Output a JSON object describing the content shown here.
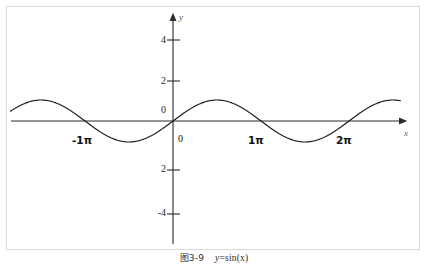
{
  "figure": {
    "caption_number": "图3-9",
    "caption_expression": "y=sin(x)",
    "caption_expr_lhs": "y",
    "caption_expr_rhs": "=sin(x)",
    "background_color": "#ffffff",
    "frame_color": "#d9d9d9",
    "curve_color": "#1a1a1a",
    "axis_color": "#2b2b2b"
  },
  "axes": {
    "x_axis_name": "x",
    "y_axis_name": "y",
    "origin_label": "0",
    "y_zero_label": "0"
  },
  "chart_data": {
    "type": "line",
    "subtitle": "",
    "function": "y = sin(x)",
    "xlabel": "x",
    "ylabel": "y",
    "xlim": [
      -7.2,
      10.2
    ],
    "ylim": [
      -5.2,
      5.2
    ],
    "amplitude": 1,
    "period": 6.283185307,
    "grid": false,
    "legend": false,
    "legend_position": "none",
    "x_tick_labels": [
      "-1π",
      "0",
      "1π",
      "2π"
    ],
    "x_tick_values": [
      -3.14159265,
      0,
      3.14159265,
      6.28318531
    ],
    "y_tick_labels": [
      "4",
      "2",
      "0",
      "2",
      "-4"
    ],
    "y_tick_values": [
      4,
      2,
      0,
      -2,
      -4
    ],
    "x": [
      -6.5,
      -6.0,
      -5.5,
      -5.0,
      -4.5,
      -4.0,
      -3.5,
      -3.14159,
      -3.0,
      -2.5,
      -2.0,
      -1.5,
      -1.0,
      -0.5,
      0.0,
      0.5,
      1.0,
      1.5,
      1.5708,
      2.0,
      2.5,
      3.0,
      3.14159,
      3.5,
      4.0,
      4.5,
      4.71239,
      5.0,
      5.5,
      6.0,
      6.28319,
      6.5,
      7.0,
      7.5,
      7.85398,
      8.0,
      8.5,
      9.0,
      9.4,
      9.8
    ],
    "y": [
      -0.2151,
      -0.2794,
      0.7055,
      0.9589,
      0.9775,
      0.7568,
      0.3508,
      0.0,
      -0.1411,
      -0.5985,
      -0.9093,
      -0.9975,
      -0.8415,
      -0.4794,
      0.0,
      0.4794,
      0.8415,
      0.9975,
      1.0,
      0.9093,
      0.5985,
      0.1411,
      0.0,
      -0.3508,
      -0.7568,
      -0.9775,
      -1.0,
      -0.9589,
      -0.7055,
      -0.2794,
      0.0,
      0.2151,
      0.657,
      0.938,
      1.0,
      0.9894,
      0.7985,
      0.4121,
      0.0752,
      -0.3665
    ],
    "series": [
      {
        "name": "y=sin(x)",
        "color": "#1a1a1a",
        "line_width": 1.1
      }
    ],
    "annotations": [
      {
        "text": "y",
        "role": "y-axis-name",
        "italic": true
      },
      {
        "text": "x",
        "role": "x-axis-name",
        "italic": true
      },
      {
        "text": "0",
        "role": "origin-label"
      }
    ]
  }
}
